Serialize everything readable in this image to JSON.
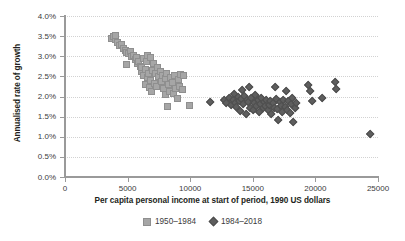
{
  "chart_data": {
    "type": "scatter",
    "title": "",
    "xlabel": "Per capita personal income at start of period, 1990 US dollars",
    "ylabel": "Annualised rate of growth",
    "xlim": [
      0,
      25000
    ],
    "ylim": [
      0,
      0.04
    ],
    "grid": true,
    "legend_position": "bottom",
    "xticks": [
      0,
      5000,
      10000,
      15000,
      20000,
      25000
    ],
    "xtick_labels": [
      "0",
      "5000",
      "10000",
      "15000",
      "20000",
      "25000"
    ],
    "yticks": [
      0,
      0.005,
      0.01,
      0.015,
      0.02,
      0.025,
      0.03,
      0.035,
      0.04
    ],
    "ytick_labels": [
      "0.0%",
      "0.5%",
      "1.0%",
      "1.5%",
      "2.0%",
      "2.5%",
      "3.0%",
      "3.5%",
      "4.0%"
    ],
    "colors": {
      "series_1950_1984": "#a6a6a6",
      "series_1984_2018": "#5e5e5e",
      "axis": "#9a9a9a",
      "gridline": "#d2d2d2",
      "text": "#231f20"
    },
    "series": [
      {
        "name": "1950–1984",
        "marker": "square",
        "color": "#a6a6a6",
        "points": [
          [
            3700,
            0.0345
          ],
          [
            3850,
            0.0349
          ],
          [
            4000,
            0.0341
          ],
          [
            4050,
            0.0352
          ],
          [
            4200,
            0.0333
          ],
          [
            4350,
            0.0327
          ],
          [
            4500,
            0.0329
          ],
          [
            4650,
            0.032
          ],
          [
            4800,
            0.0315
          ],
          [
            4950,
            0.031
          ],
          [
            4900,
            0.0279
          ],
          [
            5100,
            0.0306
          ],
          [
            5250,
            0.0312
          ],
          [
            5350,
            0.0299
          ],
          [
            5450,
            0.0302
          ],
          [
            5600,
            0.0291
          ],
          [
            5700,
            0.0296
          ],
          [
            5800,
            0.0283
          ],
          [
            5900,
            0.0287
          ],
          [
            6000,
            0.0275
          ],
          [
            6100,
            0.0262
          ],
          [
            6150,
            0.0271
          ],
          [
            6250,
            0.0294
          ],
          [
            6300,
            0.0253
          ],
          [
            6400,
            0.0267
          ],
          [
            6450,
            0.0231
          ],
          [
            6500,
            0.0288
          ],
          [
            6550,
            0.0247
          ],
          [
            6600,
            0.0302
          ],
          [
            6700,
            0.0258
          ],
          [
            6750,
            0.0222
          ],
          [
            6800,
            0.0296
          ],
          [
            6850,
            0.024
          ],
          [
            6900,
            0.0213
          ],
          [
            7000,
            0.0265
          ],
          [
            7050,
            0.0281
          ],
          [
            7150,
            0.0233
          ],
          [
            7250,
            0.0257
          ],
          [
            7300,
            0.0226
          ],
          [
            7400,
            0.0272
          ],
          [
            7500,
            0.0249
          ],
          [
            7600,
            0.0263
          ],
          [
            7700,
            0.0238
          ],
          [
            7800,
            0.0252
          ],
          [
            7900,
            0.0219
          ],
          [
            8000,
            0.0244
          ],
          [
            8050,
            0.0204
          ],
          [
            8100,
            0.0256
          ],
          [
            8150,
            0.0174
          ],
          [
            8250,
            0.0229
          ],
          [
            8350,
            0.0212
          ],
          [
            8450,
            0.0248
          ],
          [
            8550,
            0.0236
          ],
          [
            8650,
            0.0208
          ],
          [
            8750,
            0.0253
          ],
          [
            8850,
            0.0221
          ],
          [
            8950,
            0.0196
          ],
          [
            9050,
            0.0241
          ],
          [
            9150,
            0.0225
          ],
          [
            9250,
            0.0254
          ],
          [
            9350,
            0.0218
          ],
          [
            9450,
            0.0252
          ],
          [
            9950,
            0.0178
          ]
        ]
      },
      {
        "name": "1984–2018",
        "marker": "diamond",
        "color": "#5e5e5e",
        "points": [
          [
            11600,
            0.0187
          ],
          [
            12700,
            0.019
          ],
          [
            12900,
            0.0184
          ],
          [
            13100,
            0.0196
          ],
          [
            13250,
            0.0178
          ],
          [
            13400,
            0.0192
          ],
          [
            13500,
            0.0205
          ],
          [
            13600,
            0.0183
          ],
          [
            13700,
            0.0174
          ],
          [
            13800,
            0.0198
          ],
          [
            13900,
            0.0188
          ],
          [
            14000,
            0.0163
          ],
          [
            14100,
            0.0193
          ],
          [
            14150,
            0.0216
          ],
          [
            14250,
            0.018
          ],
          [
            14350,
            0.0202
          ],
          [
            14450,
            0.0157
          ],
          [
            14550,
            0.0191
          ],
          [
            14650,
            0.0186
          ],
          [
            14700,
            0.0222
          ],
          [
            14800,
            0.0172
          ],
          [
            14900,
            0.0195
          ],
          [
            15000,
            0.0167
          ],
          [
            15100,
            0.0184
          ],
          [
            15200,
            0.0203
          ],
          [
            15300,
            0.0176
          ],
          [
            15400,
            0.019
          ],
          [
            15500,
            0.0161
          ],
          [
            15600,
            0.0181
          ],
          [
            15700,
            0.0197
          ],
          [
            15800,
            0.017
          ],
          [
            15900,
            0.0186
          ],
          [
            16000,
            0.0175
          ],
          [
            16100,
            0.0192
          ],
          [
            16200,
            0.0165
          ],
          [
            16300,
            0.0179
          ],
          [
            16400,
            0.0188
          ],
          [
            16500,
            0.0155
          ],
          [
            16600,
            0.0183
          ],
          [
            16700,
            0.0172
          ],
          [
            16750,
            0.0223
          ],
          [
            16850,
            0.0194
          ],
          [
            16950,
            0.0168
          ],
          [
            17050,
            0.0142
          ],
          [
            17150,
            0.0185
          ],
          [
            17250,
            0.0177
          ],
          [
            17350,
            0.016
          ],
          [
            17450,
            0.0191
          ],
          [
            17550,
            0.0173
          ],
          [
            17650,
            0.0212
          ],
          [
            17750,
            0.0166
          ],
          [
            17850,
            0.0189
          ],
          [
            17950,
            0.0158
          ],
          [
            18050,
            0.0181
          ],
          [
            18150,
            0.0196
          ],
          [
            18250,
            0.0135
          ],
          [
            18350,
            0.017
          ],
          [
            18450,
            0.0184
          ],
          [
            19400,
            0.0228
          ],
          [
            19550,
            0.0214
          ],
          [
            19750,
            0.0189
          ],
          [
            20550,
            0.0197
          ],
          [
            21550,
            0.0236
          ],
          [
            21650,
            0.0217
          ],
          [
            24400,
            0.0106
          ]
        ]
      }
    ]
  },
  "legend": {
    "entries": [
      {
        "label": "1950–1984",
        "marker": "square"
      },
      {
        "label": "1984–2018",
        "marker": "diamond"
      }
    ]
  }
}
